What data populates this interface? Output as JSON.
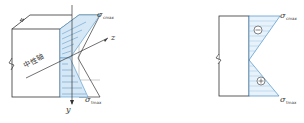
{
  "figure": {
    "panels": [
      {
        "id": "panel-3d",
        "labels": {
          "neutral_axis": "中性轴",
          "axis_z": "z",
          "axis_y": "y",
          "top_stress_sym": "σ",
          "top_stress_sub": "cmax",
          "bottom_stress_sym": "σ",
          "bottom_stress_sub": "tmax"
        }
      },
      {
        "id": "panel-arrows",
        "labels": {
          "top_stress_sym": "σ",
          "top_stress_sub": "cmax",
          "bottom_stress_sym": "σ",
          "bottom_stress_sub": "tmax"
        }
      },
      {
        "id": "panel-signs",
        "labels": {
          "top_stress_sym": "σ",
          "top_stress_sub": "cmax",
          "bottom_stress_sym": "σ",
          "bottom_stress_sub": "tmax",
          "compression_sign": "−",
          "tension_sign": "+"
        }
      }
    ],
    "colors": {
      "line": "#333333",
      "stress_blue": "#4a90c8",
      "fill_blue": "#d6e8f5"
    }
  }
}
